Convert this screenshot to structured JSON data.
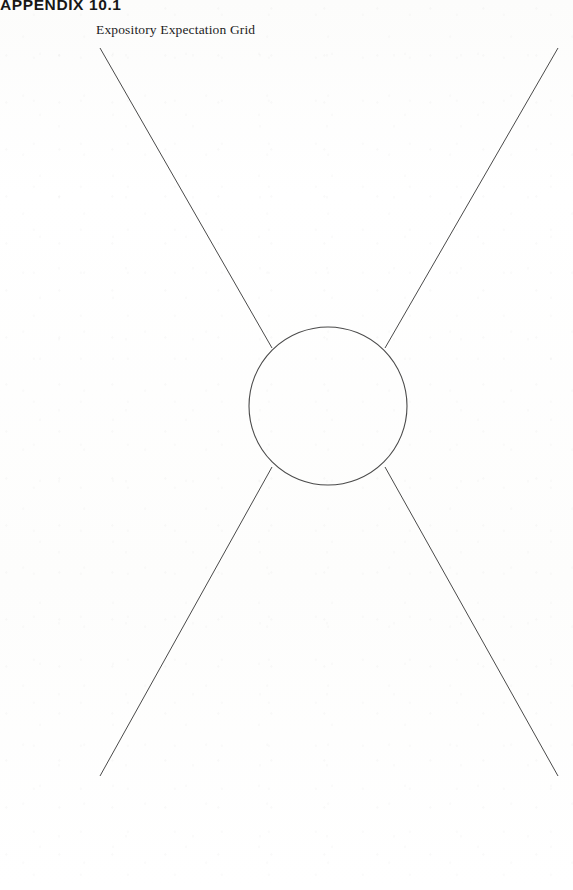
{
  "page": {
    "background_color": "#fdfdfd",
    "ink_color": "#4a4a4a",
    "text_color": "#171717"
  },
  "header": {
    "appendix_label": "APPENDIX 10.1",
    "worksheet_title": "Expository Expectation Grid"
  },
  "figure": {
    "name": "expository-expectation-grid",
    "center_circle": {
      "label": "",
      "cx": 328,
      "cy": 406,
      "r": 79
    },
    "branches": [
      {
        "name": "branch-top-left",
        "label": "",
        "x1": 100,
        "y1": 48,
        "x2": 272,
        "y2": 348
      },
      {
        "name": "branch-top-right",
        "label": "",
        "x1": 558,
        "y1": 48,
        "x2": 385,
        "y2": 348
      },
      {
        "name": "branch-bottom-left",
        "label": "",
        "x1": 100,
        "y1": 776,
        "x2": 272,
        "y2": 467
      },
      {
        "name": "branch-bottom-right",
        "label": "",
        "x1": 558,
        "y1": 776,
        "x2": 385,
        "y2": 467
      }
    ]
  }
}
